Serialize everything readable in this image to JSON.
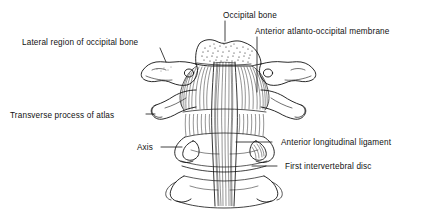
{
  "figure": {
    "view": "anterior",
    "style": "line drawing with stipple and hatch shading",
    "ink_color": "#111111",
    "background_color": "#ffffff"
  },
  "labels": {
    "occipital_bone": "Occipital bone",
    "anterior_atlanto_occipital_membrane": "Anterior atlanto-occipital membrane",
    "lateral_region_of_occipital_bone": "Lateral region of occipital bone",
    "transverse_process_of_atlas": "Transverse process of atlas",
    "axis": "Axis",
    "anterior_longitudinal_ligament": "Anterior longitudinal ligament",
    "first_intervertebral_disc": "First intervertebral disc"
  },
  "structures": [
    {
      "name": "occipital-bone",
      "label": "Occipital bone"
    },
    {
      "name": "anterior-atlanto-occipital-membrane",
      "label": "Anterior atlanto-occipital membrane"
    },
    {
      "name": "lateral-region-of-occipital-bone",
      "label": "Lateral region of occipital bone"
    },
    {
      "name": "transverse-process-of-atlas",
      "label": "Transverse process of atlas"
    },
    {
      "name": "axis",
      "label": "Axis"
    },
    {
      "name": "anterior-longitudinal-ligament",
      "label": "Anterior longitudinal ligament"
    },
    {
      "name": "first-intervertebral-disc",
      "label": "First intervertebral disc"
    }
  ]
}
